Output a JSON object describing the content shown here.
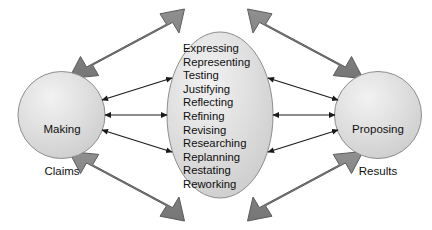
{
  "diagram": {
    "type": "cycle-interaction-diagram",
    "background_color": "#ffffff",
    "nodes": {
      "left": {
        "name": "making-claims",
        "shape": "circle",
        "line1": "Making",
        "line2": "Claims",
        "fill": "#dcdcdc",
        "stroke": "#8a8a8a"
      },
      "right": {
        "name": "proposing-results",
        "shape": "circle",
        "line1": "Proposing",
        "line2": "Results",
        "fill": "#dcdcdc",
        "stroke": "#8a8a8a"
      },
      "center": {
        "name": "processes",
        "shape": "ellipse",
        "fill": "#dcdcdc",
        "stroke": "#8a8a8a",
        "items": [
          "Expressing",
          "Representing",
          "Testing",
          "Justifying",
          "Reflecting",
          "Refining",
          "Revising",
          "Researching",
          "Replanning",
          "Restating",
          "Reworking"
        ]
      }
    },
    "thick_arrows": {
      "fill": "#808080",
      "stroke": "#5f5f5f",
      "style": "double-headed",
      "count": 4,
      "positions": [
        "top-left",
        "top-right",
        "bottom-left",
        "bottom-right"
      ]
    },
    "thin_arrows": {
      "color": "#1a1a1a",
      "style": "double-headed",
      "count_per_side": 3,
      "sides": [
        "left",
        "right"
      ]
    }
  }
}
